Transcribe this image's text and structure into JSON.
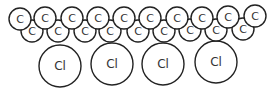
{
  "diagram": {
    "stroke_color": "#222222",
    "carbon_label": "C",
    "chlorine_label": "Cl",
    "carbon_radius": 11,
    "chlorine_radius": 21,
    "carbons_top": [
      {
        "x": 20,
        "y": 19
      },
      {
        "x": 45,
        "y": 18
      },
      {
        "x": 72,
        "y": 18
      },
      {
        "x": 98,
        "y": 18
      },
      {
        "x": 124,
        "y": 18
      },
      {
        "x": 150,
        "y": 18
      },
      {
        "x": 177,
        "y": 18
      },
      {
        "x": 202,
        "y": 18
      },
      {
        "x": 228,
        "y": 17
      },
      {
        "x": 255,
        "y": 16
      }
    ],
    "carbons_bottom": [
      {
        "x": 32,
        "y": 31
      },
      {
        "x": 58,
        "y": 31
      },
      {
        "x": 85,
        "y": 31
      },
      {
        "x": 110,
        "y": 31
      },
      {
        "x": 138,
        "y": 31
      },
      {
        "x": 164,
        "y": 31
      },
      {
        "x": 190,
        "y": 30
      },
      {
        "x": 216,
        "y": 30
      },
      {
        "x": 243,
        "y": 29
      }
    ],
    "chlorines": [
      {
        "x": 60,
        "y": 66,
        "label": "Cl"
      },
      {
        "x": 112,
        "y": 64,
        "label": "Cl"
      },
      {
        "x": 163,
        "y": 64,
        "label": "Cl"
      },
      {
        "x": 216,
        "y": 62,
        "label": "Cl"
      }
    ]
  }
}
